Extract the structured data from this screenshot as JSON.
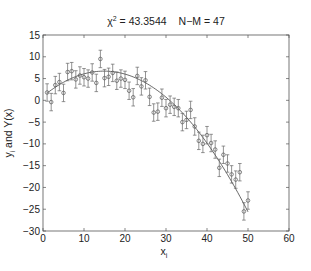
{
  "chart_data": {
    "type": "scatter",
    "title_parts": {
      "chi_symbol": "χ",
      "chi_exp": "2",
      "chi_value": " = 43.3544",
      "dof": "N−M = 47"
    },
    "xlabel": "x",
    "xlabel_sub": "i",
    "ylabel": "y",
    "ylabel_sub": "i",
    "ylabel_rest": " and Y(x)",
    "xlim": [
      0,
      60
    ],
    "ylim": [
      -30,
      15
    ],
    "xticks": [
      0,
      10,
      20,
      30,
      40,
      50,
      60
    ],
    "yticks": [
      -30,
      -25,
      -20,
      -15,
      -10,
      -5,
      0,
      5,
      10,
      15
    ],
    "grid": false,
    "legend": null,
    "series": [
      {
        "name": "data points with error bars",
        "marker": "circle",
        "error_bar": 2.0,
        "x": [
          1,
          2,
          3,
          4,
          5,
          6,
          7,
          8,
          9,
          10,
          11,
          12,
          13,
          14,
          15,
          16,
          17,
          18,
          19,
          20,
          21,
          22,
          23,
          24,
          25,
          26,
          27,
          28,
          29,
          30,
          31,
          32,
          33,
          34,
          35,
          36,
          37,
          38,
          39,
          40,
          41,
          42,
          43,
          44,
          45,
          46,
          47,
          48,
          49,
          50
        ],
        "y": [
          1.8,
          -0.4,
          3.5,
          4.2,
          1.7,
          6.5,
          6.7,
          4.8,
          5.7,
          5.3,
          5.0,
          6.4,
          4.0,
          9.5,
          5.1,
          5.4,
          6.3,
          4.5,
          5.0,
          4.7,
          2.2,
          0.7,
          5.6,
          3.2,
          4.6,
          0.8,
          -2.8,
          -2.6,
          0.6,
          -1.8,
          -1.0,
          -1.5,
          -1.8,
          -5.0,
          -4.5,
          -2.2,
          -6.0,
          -9.3,
          -10.0,
          -8.0,
          -9.8,
          -11.3,
          -15.5,
          -12.5,
          -14.5,
          -17.0,
          -18.2,
          -16.5,
          -25.5,
          -23.0
        ]
      },
      {
        "name": "Y(x) fitted curve",
        "type": "line",
        "model": "quadratic",
        "coefficients": {
          "a": 0.9,
          "b": 0.78,
          "c": -0.0262
        }
      }
    ]
  }
}
